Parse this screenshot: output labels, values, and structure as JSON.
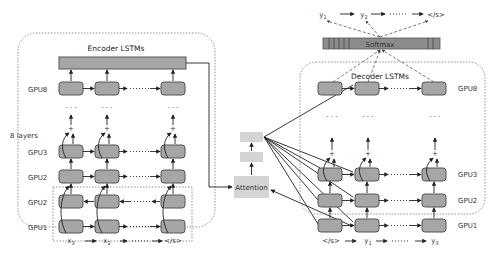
{
  "encoder": {
    "title": "Encoder LSTMs",
    "layers_label": "8 layers",
    "gpu_labels": [
      "GPU8",
      "GPU3",
      "GPU2",
      "GPU2",
      "GPU1"
    ],
    "inputs": [
      "x3",
      "x2",
      "</s>"
    ],
    "input_subscripts": [
      "3",
      "2",
      ""
    ],
    "dots": "· · ·"
  },
  "attention": {
    "label": "Attention"
  },
  "decoder": {
    "title": "Decoder LSTMs",
    "gpu_labels": [
      "GPU8",
      "GPU3",
      "GPU2",
      "GPU1"
    ],
    "inputs": [
      "</s>",
      "y1",
      "y3"
    ],
    "dots": "· · ·"
  },
  "softmax": {
    "label": "Softmax"
  },
  "outputs": [
    "y1",
    "y2",
    "</s>"
  ],
  "colors": {
    "node_fill": "#a6a6a6",
    "softmax_fill": "#8c8c8c",
    "attention_fill": "#d4d4d4"
  }
}
